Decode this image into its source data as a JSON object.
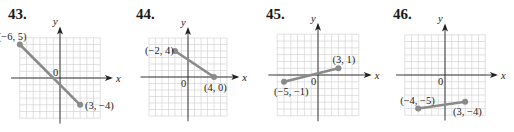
{
  "problems": [
    {
      "number": "43.",
      "x_axis_label": "x",
      "y_axis_label": "y",
      "origin_label": "0",
      "points": [
        {
          "label": "(−6, 5)",
          "x": -6,
          "y": 5
        },
        {
          "label": "(3, −4)",
          "x": 3,
          "y": -4
        }
      ]
    },
    {
      "number": "44.",
      "x_axis_label": "x",
      "y_axis_label": "y",
      "origin_label": "0",
      "points": [
        {
          "label": "(−2, 4)",
          "x": -2,
          "y": 4
        },
        {
          "label": "(4, 0)",
          "x": 4,
          "y": 0
        }
      ]
    },
    {
      "number": "45.",
      "x_axis_label": "x",
      "y_axis_label": "y",
      "origin_label": "0",
      "points": [
        {
          "label": "(−5, −1)",
          "x": -5,
          "y": -1
        },
        {
          "label": "(3, 1)",
          "x": 3,
          "y": 1
        }
      ]
    },
    {
      "number": "46.",
      "x_axis_label": "x",
      "y_axis_label": "y",
      "origin_label": "0",
      "points": [
        {
          "label": "(−4, −5)",
          "x": -4,
          "y": -5
        },
        {
          "label": "(3, −4)",
          "x": 3,
          "y": -4
        }
      ]
    }
  ],
  "colors": {
    "grid": "#d4d4d4",
    "axis": "#222222",
    "segment": "#8a8a8a",
    "point": "#8a8a8a"
  }
}
